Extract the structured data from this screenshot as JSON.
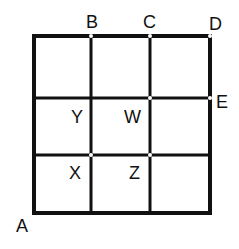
{
  "diagram": {
    "type": "3x3 grid",
    "colors": {
      "line": "#111111",
      "background": "#ffffff",
      "junction": "#ffffff"
    },
    "grid": {
      "left": 34,
      "right": 210,
      "top": 36,
      "bottom": 213,
      "vlines": [
        91,
        150
      ],
      "hlines": [
        98,
        155
      ]
    },
    "labels": {
      "A": "A",
      "B": "B",
      "C": "C",
      "D": "D",
      "E": "E",
      "W": "W",
      "X": "X",
      "Y": "Y",
      "Z": "Z"
    }
  }
}
